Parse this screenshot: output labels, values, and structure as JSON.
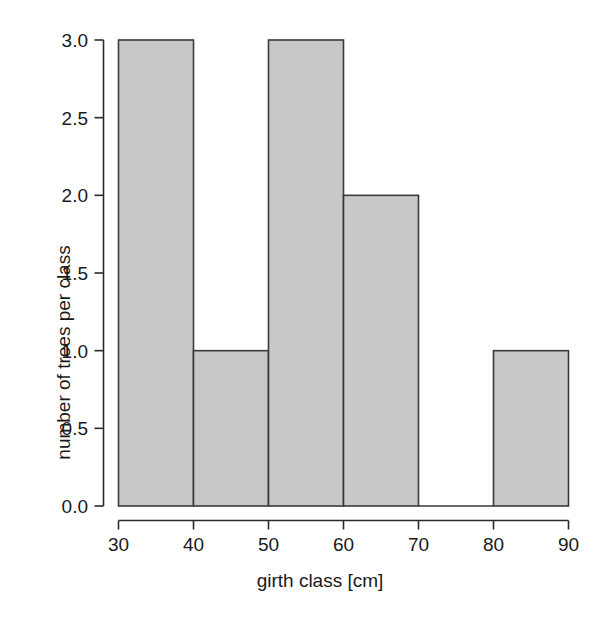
{
  "chart_data": {
    "type": "bar",
    "subtype": "histogram",
    "title": "",
    "xlabel": "girth class [cm]",
    "ylabel": "number of trees per class",
    "categories": [
      "30-40",
      "40-50",
      "50-60",
      "60-70",
      "70-80",
      "80-90"
    ],
    "bin_edges": [
      30,
      40,
      50,
      60,
      70,
      80,
      90
    ],
    "bin_width": 10,
    "values": [
      3,
      1,
      3,
      2,
      0,
      1
    ],
    "xlim": [
      30,
      90
    ],
    "ylim": [
      0,
      3
    ],
    "xticks": [
      30,
      40,
      50,
      60,
      70,
      80,
      90
    ],
    "xtick_labels": [
      "30",
      "40",
      "50",
      "60",
      "70",
      "80",
      "90"
    ],
    "yticks": [
      0.0,
      0.5,
      1.0,
      1.5,
      2.0,
      2.5,
      3.0
    ],
    "ytick_labels": [
      "0.0",
      "0.5",
      "1.0",
      "1.5",
      "2.0",
      "2.5",
      "3.0"
    ],
    "grid": false,
    "legend": null,
    "colors": {
      "bar_fill": "#c8c8c8",
      "bar_edge": "#3a3a3a",
      "axis": "#2b2b2b",
      "text": "#1a1a1a",
      "background": "#ffffff"
    }
  }
}
